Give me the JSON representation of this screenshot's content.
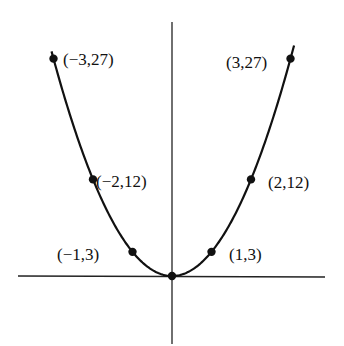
{
  "chart_data": {
    "type": "line",
    "title": "",
    "xlabel": "",
    "ylabel": "",
    "function": "y = 3x^2",
    "grid": false,
    "legend": null,
    "xlim": [
      -3.2,
      3.3
    ],
    "ylim": [
      -8.5,
      29.5
    ],
    "points": [
      {
        "x": -3,
        "y": 27,
        "label": "(−3,27)"
      },
      {
        "x": -2,
        "y": 12,
        "label": "(−2,12)"
      },
      {
        "x": -1,
        "y": 3,
        "label": "(−1,3)"
      },
      {
        "x": 0,
        "y": 0,
        "label": ""
      },
      {
        "x": 1,
        "y": 3,
        "label": "(1,3)"
      },
      {
        "x": 2,
        "y": 12,
        "label": "(2,12)"
      },
      {
        "x": 3,
        "y": 27,
        "label": "(3,27)"
      }
    ],
    "colors": {
      "line": "#111111",
      "axis": "#222222",
      "background": "#ffffff"
    }
  }
}
